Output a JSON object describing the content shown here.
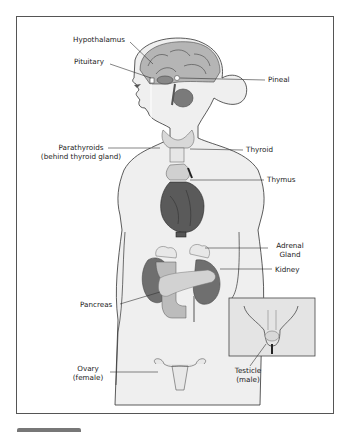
{
  "diagram": {
    "labels": {
      "hypothalamus": "Hypothalamus",
      "pituitary": "Pituitary",
      "pineal": "Pineal",
      "parathyroids_line1": "Parathyroids",
      "parathyroids_line2": "(behind thyroid gland)",
      "thyroid": "Thyroid",
      "thymus": "Thymus",
      "adrenal_line1": "Adrenal",
      "adrenal_line2": "Gland",
      "kidney": "Kidney",
      "pancreas": "Pancreas",
      "ovary_line1": "Ovary",
      "ovary_line2": "(female)",
      "testicle_line1": "Testicle",
      "testicle_line2": "(male)"
    },
    "colors": {
      "skin": "#ececec",
      "outline": "#333333",
      "brain": "#a8a8a8",
      "organ_dark": "#555555",
      "inset_bg": "#e4e4e4"
    }
  }
}
